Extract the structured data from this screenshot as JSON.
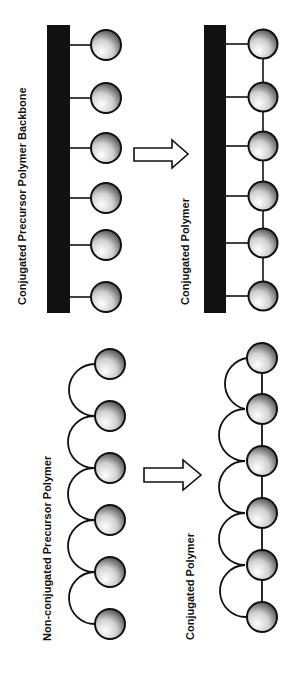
{
  "figure": {
    "top_panel": {
      "precursor_label": "Conjugated Precursor Polymer Backbone",
      "product_label": "Conjugated Polymer",
      "precursor_pendant_count": 6,
      "product_pendant_count": 6
    },
    "bottom_panel": {
      "precursor_label": "Non-conjugated Precursor Polymer",
      "product_label": "Conjugated Polymer",
      "precursor_unit_count": 6,
      "product_unit_count": 6
    },
    "arrows": [
      "reaction-arrow",
      "reaction-arrow"
    ],
    "colors": {
      "backbone": "#111111",
      "line": "#111111",
      "sphere_highlight": "#ffffff",
      "sphere_shadow": "#3a3a3a"
    }
  }
}
